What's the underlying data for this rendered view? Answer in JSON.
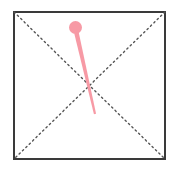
{
  "canvas": {
    "width": 177,
    "height": 175,
    "background_color": "#ffffff",
    "description": "Square outlined region with dotted X diagonals and a pink pin marker"
  },
  "frame": {
    "name": "square-frame",
    "x": 13,
    "y": 11,
    "width": 153,
    "height": 149,
    "stroke_color": "#3a3a3a",
    "stroke_width": 2,
    "fill_color": "#ffffff"
  },
  "diagonals": {
    "stroke_color": "#555555",
    "stroke_width": 1.4,
    "dash_pattern": "1.5 3.2",
    "lines": [
      {
        "name": "diagonal-top-left-to-bottom-right",
        "x1": 14,
        "y1": 12,
        "x2": 165,
        "y2": 159
      },
      {
        "name": "diagonal-top-right-to-bottom-left",
        "x1": 165,
        "y1": 12,
        "x2": 14,
        "y2": 159
      }
    ],
    "center_x": 89.5,
    "center_y": 85.5
  },
  "pin": {
    "name": "pink-pin-marker",
    "color": "#f79aa5",
    "head": {
      "center_x": 75.5,
      "center_y": 27.5,
      "radius": 6.5
    },
    "shaft": {
      "x1": 76.5,
      "y1": 33,
      "x2": 95,
      "y2": 114,
      "width_top": 4.6,
      "width_bottom": 2.2
    }
  }
}
